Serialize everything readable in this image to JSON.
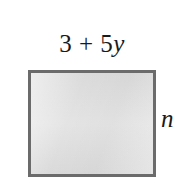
{
  "figure": {
    "type": "rectangle-diagram",
    "background_color": "#ffffff",
    "width_label": {
      "full_text": "3 + 5y",
      "expression": "3 + 5",
      "variable": "y"
    },
    "height_label": {
      "full_text": "n",
      "variable": "n"
    },
    "shape": {
      "name": "rectangle",
      "fill_color": "#dedede",
      "border_color": "#6b6b6b",
      "border_width_px": 3
    }
  }
}
